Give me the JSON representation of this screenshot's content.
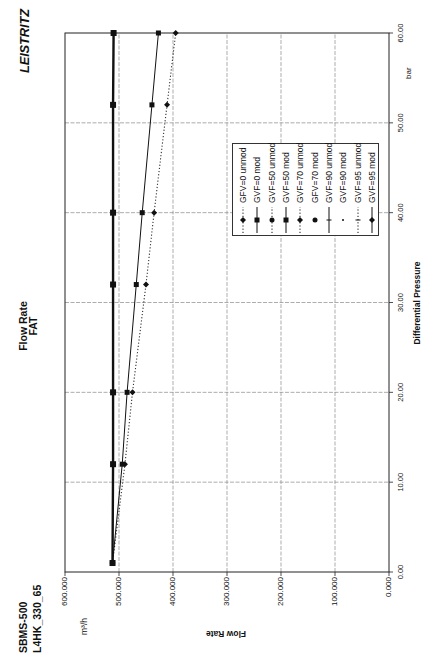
{
  "header": {
    "brand": "LEISTRITZ",
    "model": "SBMS-500",
    "code": "L4HK_330_65"
  },
  "chart_data": {
    "type": "line",
    "orientation": "rotated 90° counter-clockwise",
    "title": "Flow Rate FAT",
    "title_lines": [
      "Flow Rate",
      "FAT"
    ],
    "xlabel": "Differential Pressure",
    "xunit": "bar",
    "ylabel": "Flow Rate",
    "yunit": "m³/h",
    "xlim": [
      0,
      60
    ],
    "ylim": [
      0,
      600
    ],
    "xticks": [
      "0.00",
      "10.00",
      "20.00",
      "30.00",
      "40.00",
      "50.00",
      "60.00"
    ],
    "yticks": [
      "0.000",
      "100.000",
      "200.000",
      "300.000",
      "400.000",
      "500.000",
      "600.000"
    ],
    "grid": true,
    "legend_position": "inside plot, right of center",
    "legend": [
      {
        "label": "GFV=0 unmod",
        "line": "dotted",
        "marker": "diamond"
      },
      {
        "label": "GVF=0 mod",
        "line": "solid",
        "marker": "square"
      },
      {
        "label": "GVF=50 unmod",
        "line": "dotted",
        "marker": "circle"
      },
      {
        "label": "GVF=50 mod",
        "line": "solid",
        "marker": "square"
      },
      {
        "label": "GVF=70 unmod",
        "line": "dotted",
        "marker": "diamond"
      },
      {
        "label": "GFV=70 mod",
        "line": "none",
        "marker": "circle"
      },
      {
        "label": "GVF=90 unmod",
        "line": "solid",
        "marker": "vbar"
      },
      {
        "label": "GVF=90 mod",
        "line": "none",
        "marker": "dot"
      },
      {
        "label": "GVF=95 unmod",
        "line": "dotted",
        "marker": "vbar"
      },
      {
        "label": "GVF=95 mod",
        "line": "solid",
        "marker": "diamond"
      }
    ],
    "x": [
      1,
      12,
      20,
      32,
      40,
      52,
      60
    ],
    "series": [
      {
        "name": "GVF=50 mod",
        "line": "solid",
        "marker": "square",
        "values": [
          512,
          511,
          511,
          511,
          511,
          511,
          510
        ]
      },
      {
        "name": "GVF=0 mod",
        "line": "solid",
        "marker": "square",
        "values": [
          512,
          494,
          485,
          468,
          457,
          439,
          427
        ]
      },
      {
        "name": "GFV=0 unmod",
        "line": "dotted",
        "marker": "diamond",
        "values": [
          512,
          489,
          475,
          450,
          435,
          411,
          395
        ]
      }
    ]
  }
}
